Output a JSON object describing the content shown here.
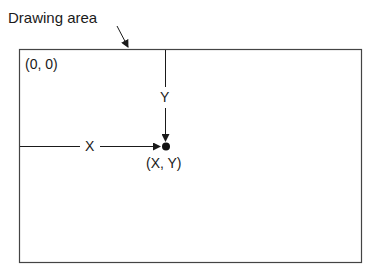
{
  "diagram": {
    "title": "Drawing area",
    "origin_label": "(0, 0)",
    "x_label": "X",
    "y_label": "Y",
    "point_label": "(X, Y)"
  },
  "colors": {
    "line": "#1a1a1a",
    "border": "#444444",
    "background": "#ffffff"
  }
}
